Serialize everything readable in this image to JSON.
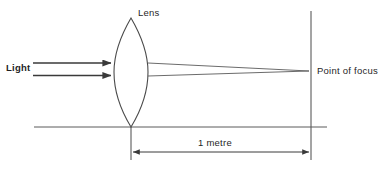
{
  "figure": {
    "width": 382,
    "height": 169,
    "background_color": "#ffffff",
    "line_color": "#4a4a4a",
    "text_color": "#1f1f1f"
  },
  "labels": {
    "lens": "Lens",
    "light": "Light",
    "point_of_focus": "Point of focus",
    "distance": "1 metre"
  },
  "diagram_data": {
    "type": "optics-ray-diagram",
    "description": "Parallel light rays entering a convex lens converge to a point of focus 1 metre away",
    "lens": {
      "shape": "biconvex",
      "apex_top": [
        131,
        18
      ],
      "apex_bottom": [
        131,
        127
      ],
      "half_width": 17,
      "center_y": 72
    },
    "incoming_rays": [
      {
        "from": [
          33,
          63
        ],
        "to": [
          114,
          63
        ],
        "arrowhead": "end"
      },
      {
        "from": [
          33,
          75
        ],
        "to": [
          114,
          75
        ],
        "arrowhead": "end"
      }
    ],
    "converging_rays": [
      {
        "from": [
          148,
          63
        ],
        "to": [
          305,
          71
        ]
      },
      {
        "from": [
          148,
          76
        ],
        "to": [
          305,
          71
        ]
      }
    ],
    "focal_plane": {
      "x": 311,
      "y_top": 11,
      "y_bottom": 160
    },
    "optical_axis": {
      "y": 127,
      "x_start": 34,
      "x_end": 327
    },
    "lens_axis_tick": {
      "x": 131,
      "y_start": 127,
      "y_end": 160
    },
    "dimension": {
      "y": 152,
      "x_start": 131,
      "x_end": 311,
      "value": "1 metre",
      "arrowheads": "both"
    }
  }
}
